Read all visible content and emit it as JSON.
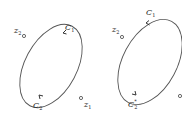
{
  "left_figure": {
    "z2": {
      "label": "z",
      "sub": "2"
    },
    "z1": {
      "label": "z",
      "sub": "1"
    },
    "c1": {
      "label": "C",
      "sub": "1"
    },
    "c2": {
      "label": "C",
      "sub": "2"
    }
  },
  "right_figure": {
    "z2": {
      "label": "z",
      "sub": "2"
    },
    "c1": {
      "label": "C",
      "sub": "1"
    },
    "c2": {
      "label": "C",
      "sub": "2",
      "sup": "*"
    }
  },
  "colors": {
    "stroke": "#555555",
    "text": "#222222"
  }
}
